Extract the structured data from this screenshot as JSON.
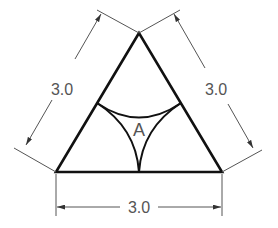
{
  "diagram": {
    "shape": "equilateral-triangle",
    "colors": {
      "outline": "#111111",
      "dimension": "#555555",
      "text": "#555555",
      "background": "#ffffff"
    },
    "dimensions": {
      "left": "3.0",
      "right": "3.0",
      "bottom": "3.0"
    },
    "region_label": "A"
  }
}
